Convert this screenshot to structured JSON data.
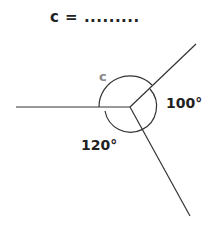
{
  "question": {
    "text": "c = ........."
  },
  "diagram": {
    "unknown_angle_label": "c",
    "angle_right": "100°",
    "angle_bottom_left": "120°"
  }
}
